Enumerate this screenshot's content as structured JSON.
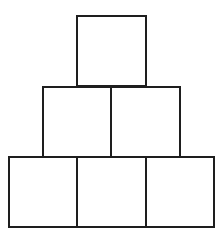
{
  "diagram": {
    "title": "",
    "stroke_color": "#1e1e1e",
    "fill_color": "#ffffff",
    "rows": [
      {
        "row": 1,
        "boxes": [
          {
            "x": 76,
            "y": 15,
            "w": 71,
            "h": 72
          }
        ]
      },
      {
        "row": 2,
        "boxes": [
          {
            "x": 42,
            "y": 86,
            "w": 70,
            "h": 72
          },
          {
            "x": 110,
            "y": 86,
            "w": 71,
            "h": 72
          }
        ]
      },
      {
        "row": 3,
        "boxes": [
          {
            "x": 8,
            "y": 156,
            "w": 70,
            "h": 72
          },
          {
            "x": 76,
            "y": 156,
            "w": 71,
            "h": 72
          },
          {
            "x": 145,
            "y": 156,
            "w": 70,
            "h": 72
          }
        ]
      }
    ]
  }
}
